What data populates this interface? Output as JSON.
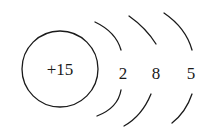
{
  "diagram": {
    "type": "atomic-structure",
    "nucleus": {
      "label": "+15"
    },
    "shells": [
      {
        "electrons": "2"
      },
      {
        "electrons": "8"
      },
      {
        "electrons": "5"
      }
    ],
    "colors": {
      "ink": "#1a1a1a",
      "background": "#ffffff"
    }
  }
}
